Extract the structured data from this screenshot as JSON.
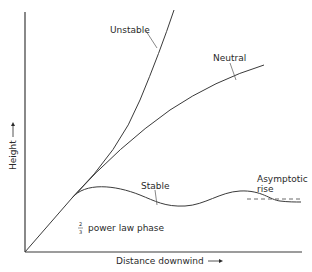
{
  "diagram": {
    "type": "plume-rise-schematic",
    "axes": {
      "x_label": "Distance downwind",
      "x_arrow": "→",
      "y_label": "Height",
      "y_arrow": "→"
    },
    "curves": [
      {
        "id": "unstable",
        "label": "Unstable"
      },
      {
        "id": "neutral",
        "label": "Neutral"
      },
      {
        "id": "stable",
        "label": "Stable"
      }
    ],
    "annotations": {
      "asymptotic_line1": "Asymptotic",
      "asymptotic_line2": "rise",
      "power_law_fraction_num": "2",
      "power_law_fraction_den": "3",
      "power_law_text": "power law phase"
    },
    "colors": {
      "line": "#3a3a3a",
      "background": "#ffffff"
    }
  }
}
